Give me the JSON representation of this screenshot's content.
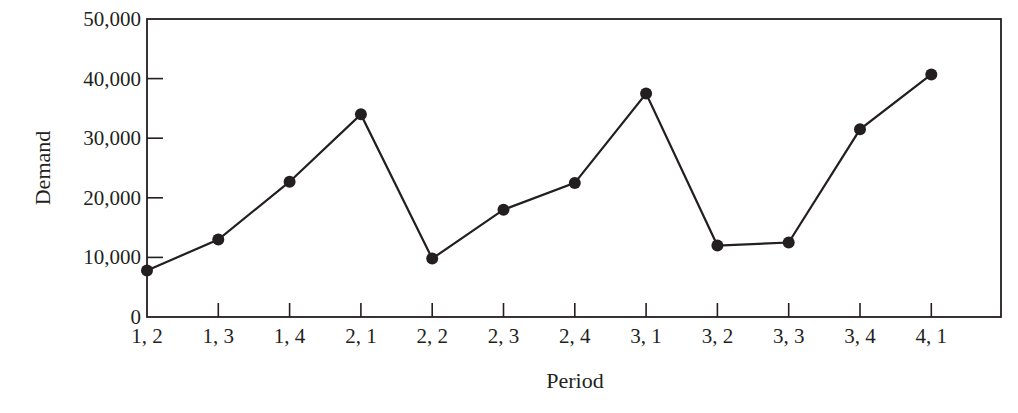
{
  "chart_data": {
    "type": "line",
    "title": "",
    "xlabel": "Period",
    "ylabel": "Demand",
    "categories": [
      "1, 2",
      "1, 3",
      "1, 4",
      "2, 1",
      "2, 2",
      "2, 3",
      "2, 4",
      "3, 1",
      "3, 2",
      "3, 3",
      "3, 4",
      "4, 1"
    ],
    "series": [
      {
        "name": "Demand",
        "values": [
          7800,
          13000,
          22700,
          34000,
          9800,
          18000,
          22500,
          37500,
          12000,
          12500,
          31500,
          40700
        ],
        "marker": "filled-circle",
        "color": "#231f20"
      }
    ],
    "ylim": [
      0,
      50000
    ],
    "yticks": [
      0,
      10000,
      20000,
      30000,
      40000,
      50000
    ],
    "ytick_labels": [
      "0",
      "10,000",
      "20,000",
      "30,000",
      "40,000",
      "50,000"
    ],
    "grid": false,
    "legend": null,
    "frame": "box"
  }
}
